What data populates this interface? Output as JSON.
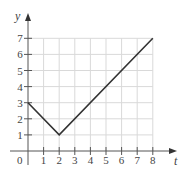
{
  "chart_data": {
    "type": "line",
    "title": "",
    "xlabel": "t",
    "ylabel": "y",
    "xlim": [
      0,
      8
    ],
    "ylim": [
      0,
      7
    ],
    "grid": true,
    "x_ticks": [
      "1",
      "2",
      "3",
      "4",
      "5",
      "6",
      "7",
      "8"
    ],
    "y_ticks": [
      "1",
      "2",
      "3",
      "4",
      "5",
      "6",
      "7"
    ],
    "origin_label": "0",
    "series": [
      {
        "name": "y(t)",
        "x": [
          0,
          2,
          8
        ],
        "y": [
          3,
          1,
          7
        ]
      }
    ]
  },
  "colors": {
    "grid": "#d9d9d9",
    "axis": "#555555",
    "line": "#333333"
  }
}
